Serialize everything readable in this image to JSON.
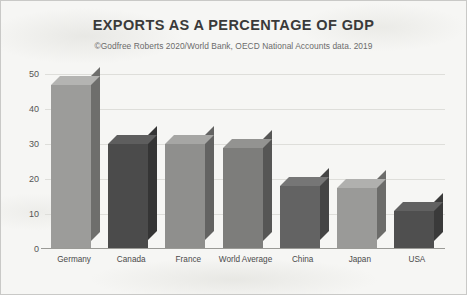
{
  "title": "EXPORTS AS A PERCENTAGE OF GDP",
  "subtitle": "©Godfree Roberts 2020/World Bank, OECD National Accounts data. 2019",
  "chart_data": {
    "type": "bar",
    "title": "EXPORTS AS A PERCENTAGE OF GDP",
    "subtitle": "©Godfree Roberts 2020/World Bank, OECD National Accounts data. 2019",
    "xlabel": "",
    "ylabel": "",
    "ylim": [
      0,
      50
    ],
    "yticks": [
      0,
      10,
      20,
      30,
      40,
      50
    ],
    "ytick_labels": [
      "0",
      "10",
      "20",
      "30",
      "40",
      "50"
    ],
    "grid": true,
    "legend": false,
    "three_d": true,
    "categories": [
      "Germany",
      "Canada",
      "France",
      "World Average",
      "China",
      "Japan",
      "USA"
    ],
    "values": [
      47,
      30,
      30,
      29,
      18,
      17.5,
      11
    ],
    "bar_colors": [
      "#9c9c9a",
      "#4b4b4b",
      "#8f8f8d",
      "#7d7d7b",
      "#636363",
      "#9a9a98",
      "#4f4f4f"
    ],
    "bar_side_colors": [
      "#6e6e6c",
      "#353535",
      "#636362",
      "#565655",
      "#454545",
      "#6c6c6a",
      "#3a3a3a"
    ],
    "bar_top_colors": [
      "#b4b4b2",
      "#5e5e5e",
      "#a6a6a4",
      "#939391",
      "#767676",
      "#b0b0ae",
      "#616161"
    ]
  },
  "colors": {
    "background": "#f6f6f4",
    "border": "#c9c9c7",
    "gridline": "#dededa",
    "axis": "#9a9a96",
    "title_text": "#3a3a3a",
    "subtitle_text": "#6b6b6b",
    "tick_text": "#555555",
    "label_text": "#4a4a4a"
  }
}
